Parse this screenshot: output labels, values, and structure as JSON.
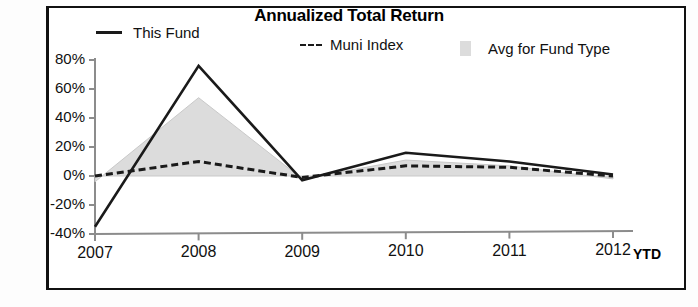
{
  "chart_data": {
    "type": "line",
    "title": "Annualized Total Return",
    "xlabel": "",
    "ylabel": "",
    "x": [
      "2007",
      "2008",
      "2009",
      "2010",
      "2011",
      "2012"
    ],
    "x_last_suffix": "YTD",
    "ylim": [
      -40,
      80
    ],
    "yticks": [
      80,
      60,
      40,
      20,
      0,
      -20,
      -40
    ],
    "ytick_labels": [
      "80%",
      "60%",
      "40%",
      "20%",
      "0%",
      "-20%",
      "-40%"
    ],
    "grid": false,
    "legend_position": "top",
    "series": [
      {
        "name": "This Fund",
        "style": "solid",
        "color": "#1a1a1a",
        "values": [
          -35,
          76,
          -3,
          16,
          10,
          1
        ]
      },
      {
        "name": "Muni Index",
        "style": "dashed",
        "color": "#1a1a1a",
        "values": [
          0,
          10,
          -1,
          7,
          6,
          0
        ]
      },
      {
        "name": "Avg for Fund Type",
        "style": "area",
        "color": "#dcdcdc",
        "values": [
          -4,
          54,
          -2,
          11,
          7,
          -2
        ]
      }
    ]
  },
  "legend": {
    "this_fund": "This Fund",
    "muni_index": "Muni Index",
    "avg_for_fund_type": "Avg for Fund Type"
  },
  "axis": {
    "y_labels": [
      "80%",
      "60%",
      "40%",
      "20%",
      "0%",
      "-20%",
      "-40%"
    ],
    "x_labels": [
      "2007",
      "2008",
      "2009",
      "2010",
      "2011",
      "2012"
    ],
    "ytd": "YTD"
  }
}
